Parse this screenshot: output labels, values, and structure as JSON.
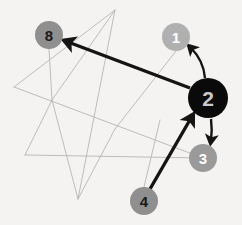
{
  "diagram": {
    "background_color": "#f4f3f1",
    "canvas": {
      "width": 242,
      "height": 225
    },
    "nodes": [
      {
        "id": "node-8",
        "label": "8",
        "cx": 49,
        "cy": 35,
        "r": 14,
        "fill": "#8f8f8f",
        "text_color": "#1a1a1a"
      },
      {
        "id": "node-1",
        "label": "1",
        "cx": 176,
        "cy": 37,
        "r": 14,
        "fill": "#b0b0b0",
        "text_color": "#ffffff"
      },
      {
        "id": "node-2",
        "label": "2",
        "cx": 208,
        "cy": 98,
        "r": 20,
        "fill": "#0a0a0a",
        "text_color": "#c9c9c9"
      },
      {
        "id": "node-3",
        "label": "3",
        "cx": 203,
        "cy": 158,
        "r": 14,
        "fill": "#9a9a9a",
        "text_color": "#ffffff"
      },
      {
        "id": "node-4",
        "label": "4",
        "cx": 144,
        "cy": 201,
        "r": 14,
        "fill": "#8f8f8f",
        "text_color": "#1a1a1a"
      }
    ],
    "graph_edges": {
      "stroke": "#b5b5b5",
      "stroke_width": 0.9,
      "paths": [
        "M115,10 L14,87",
        "M115,10 L78,199",
        "M14,87 L203,158",
        "M52,100 L25,155",
        "M25,155 L203,158",
        "M52,100 L78,199",
        "M115,10 L52,100",
        "M49,49 L52,100",
        "M176,51 L115,129",
        "M144,187 L160,120",
        "M115,129 L78,199"
      ]
    },
    "arrows": [
      {
        "id": "arrow-2-to-8",
        "from": "node-2",
        "to": "node-8",
        "kind": "straight",
        "path": "M190,88 L68,42",
        "stroke": "#141414",
        "stroke_width": 3.4
      },
      {
        "id": "arrow-4-to-2",
        "from": "node-4",
        "to": "node-2",
        "kind": "straight",
        "path": "M150,189 L191,118",
        "stroke": "#141414",
        "stroke_width": 3.4
      },
      {
        "id": "arrow-2-to-1",
        "from": "node-2",
        "to": "node-1",
        "kind": "curved",
        "path": "M205,78 C204,66 198,55 191,48",
        "stroke": "#141414",
        "stroke_width": 2.4
      },
      {
        "id": "arrow-2-to-3",
        "from": "node-2",
        "to": "node-3",
        "kind": "curved",
        "path": "M211,119 C212,127 212,133 211,140",
        "stroke": "#141414",
        "stroke_width": 2.4
      }
    ],
    "colors": {
      "arrow": "#141414",
      "edge": "#b5b5b5",
      "node_dark": "#0a0a0a",
      "node_gray": "#8f8f8f",
      "node_light": "#b0b0b0"
    }
  }
}
